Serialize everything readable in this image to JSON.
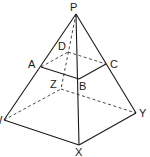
{
  "diagram": {
    "colors": {
      "stroke": "#1a1a1a",
      "background": "#ffffff"
    },
    "vertices": {
      "P": {
        "label": "P",
        "x": 76,
        "y": 14,
        "lx": 70,
        "ly": 11
      },
      "D": {
        "label": "D",
        "x": 68,
        "y": 52,
        "lx": 58,
        "ly": 50
      },
      "C": {
        "label": "C",
        "x": 106,
        "y": 64,
        "lx": 110,
        "ly": 68
      },
      "A": {
        "label": "A",
        "x": 41,
        "y": 67,
        "lx": 28,
        "ly": 68
      },
      "B": {
        "label": "B",
        "x": 79,
        "y": 79,
        "lx": 79,
        "ly": 90
      },
      "Z": {
        "label": "Z",
        "x": 61,
        "y": 89,
        "lx": 50,
        "ly": 88
      },
      "W": {
        "label": "W",
        "x": 4,
        "y": 120,
        "lx": -8,
        "ly": 124
      },
      "Y": {
        "label": "Y",
        "x": 136,
        "y": 113,
        "lx": 139,
        "ly": 117
      },
      "X": {
        "label": "X",
        "x": 79,
        "y": 145,
        "lx": 75,
        "ly": 156
      }
    },
    "solid_edges": [
      [
        "P",
        "W"
      ],
      [
        "P",
        "X"
      ],
      [
        "P",
        "Y"
      ],
      [
        "W",
        "X"
      ],
      [
        "X",
        "Y"
      ],
      [
        "A",
        "B"
      ],
      [
        "B",
        "C"
      ]
    ],
    "dashed_edges": [
      [
        "P",
        "Z"
      ],
      [
        "W",
        "Z"
      ],
      [
        "Z",
        "Y"
      ],
      [
        "A",
        "D"
      ],
      [
        "D",
        "C"
      ]
    ]
  }
}
